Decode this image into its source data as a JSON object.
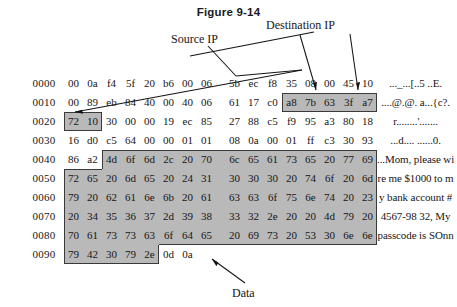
{
  "figure": {
    "title": "Figure 9-14"
  },
  "callouts": {
    "source_ip": "Source IP",
    "destination_ip": "Destination IP",
    "data": "Data"
  },
  "colors": {
    "shade": "#b9b9b9",
    "border": "#3a3a3a",
    "text": "#161616",
    "background": "#ffffff"
  },
  "hexdump": {
    "rows": [
      {
        "offset": "0000",
        "bytes": [
          "00",
          "0a",
          "f4",
          "5f",
          "20",
          "b6",
          "00",
          "06",
          "5b",
          "ec",
          "f8",
          "35",
          "08",
          "00",
          "45",
          "10"
        ],
        "ascii": "..._...[..5 ..E."
      },
      {
        "offset": "0010",
        "bytes": [
          "00",
          "89",
          "eb",
          "84",
          "40",
          "00",
          "40",
          "06",
          "61",
          "17",
          "c0",
          "a8",
          "7b",
          "63",
          "3f",
          "a7"
        ],
        "ascii": "....@.@. a...{c?."
      },
      {
        "offset": "0020",
        "bytes": [
          "72",
          "10",
          "30",
          "00",
          "00",
          "19",
          "ec",
          "85",
          "27",
          "88",
          "c5",
          "f9",
          "95",
          "a3",
          "80",
          "18"
        ],
        "ascii": "r........'......."
      },
      {
        "offset": "0030",
        "bytes": [
          "16",
          "d0",
          "c5",
          "64",
          "00",
          "00",
          "01",
          "01",
          "08",
          "0a",
          "00",
          "01",
          "ff",
          "c3",
          "30",
          "93"
        ],
        "ascii": "...d.... ......0."
      },
      {
        "offset": "0040",
        "bytes": [
          "86",
          "a2",
          "4d",
          "6f",
          "6d",
          "2c",
          "20",
          "70",
          "6c",
          "65",
          "61",
          "73",
          "65",
          "20",
          "77",
          "69"
        ],
        "ascii": "...Mom, please wi"
      },
      {
        "offset": "0050",
        "bytes": [
          "72",
          "65",
          "20",
          "6d",
          "65",
          "20",
          "24",
          "31",
          "30",
          "30",
          "30",
          "20",
          "74",
          "6f",
          "20",
          "6d"
        ],
        "ascii": "re me $1000 to m"
      },
      {
        "offset": "0060",
        "bytes": [
          "79",
          "20",
          "62",
          "61",
          "6e",
          "6b",
          "20",
          "61",
          "63",
          "63",
          "6f",
          "75",
          "6e",
          "74",
          "20",
          "23"
        ],
        "ascii": "y bank account #"
      },
      {
        "offset": "0070",
        "bytes": [
          "20",
          "34",
          "35",
          "36",
          "37",
          "2d",
          "39",
          "38",
          "33",
          "32",
          "2e",
          "20",
          "20",
          "4d",
          "79",
          "20"
        ],
        "ascii": "4567-98 32,  My"
      },
      {
        "offset": "0080",
        "bytes": [
          "70",
          "61",
          "73",
          "73",
          "63",
          "6f",
          "64",
          "65",
          "20",
          "69",
          "73",
          "20",
          "53",
          "30",
          "6e",
          "6e"
        ],
        "ascii": "passcode is SOnn"
      },
      {
        "offset": "0090",
        "bytes": [
          "79",
          "42",
          "30",
          "79",
          "2e",
          "0d",
          "0a",
          "",
          "",
          "",
          "",
          "",
          "",
          "",
          "",
          ""
        ],
        "ascii": ""
      }
    ]
  }
}
